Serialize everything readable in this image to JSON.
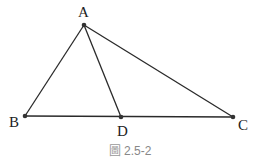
{
  "figure": {
    "points": [
      {
        "id": "A",
        "label": "A"
      },
      {
        "id": "B",
        "label": "B"
      },
      {
        "id": "C",
        "label": "C"
      },
      {
        "id": "D",
        "label": "D"
      }
    ],
    "segments": [
      {
        "from": "A",
        "to": "B"
      },
      {
        "from": "A",
        "to": "C"
      },
      {
        "from": "A",
        "to": "D"
      },
      {
        "from": "B",
        "to": "C"
      }
    ],
    "line_color": "#2a2a2a",
    "point_color": "#333333"
  },
  "caption": {
    "icon": "figure-glyph-icon",
    "icon_char": "圖",
    "text": "2.5-2"
  }
}
